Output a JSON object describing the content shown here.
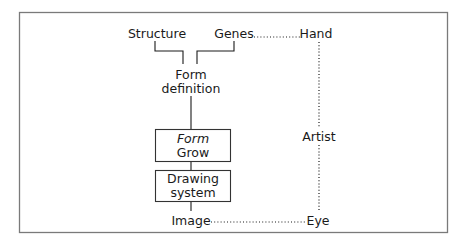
{
  "diagram": {
    "nodes": {
      "structure": "Structure",
      "genes": "Genes",
      "hand": "Hand",
      "form_definition": [
        "Form",
        "definition"
      ],
      "form_grow": [
        "Form",
        "Grow"
      ],
      "drawing_system": [
        "Drawing",
        "system"
      ],
      "image": "Image",
      "artist": "Artist",
      "eye": "Eye"
    },
    "connections": [
      {
        "from": "Structure",
        "to": "Form definition",
        "style": "solid"
      },
      {
        "from": "Genes",
        "to": "Form definition",
        "style": "solid"
      },
      {
        "from": "Form definition",
        "to": "Form Grow",
        "style": "solid"
      },
      {
        "from": "Form Grow",
        "to": "Drawing system",
        "style": "solid"
      },
      {
        "from": "Drawing system",
        "to": "Image",
        "style": "solid"
      },
      {
        "from": "Genes",
        "to": "Hand",
        "style": "dotted"
      },
      {
        "from": "Hand",
        "to": "Artist",
        "style": "dotted"
      },
      {
        "from": "Artist",
        "to": "Eye",
        "style": "dotted"
      },
      {
        "from": "Image",
        "to": "Eye",
        "style": "dotted"
      }
    ]
  }
}
